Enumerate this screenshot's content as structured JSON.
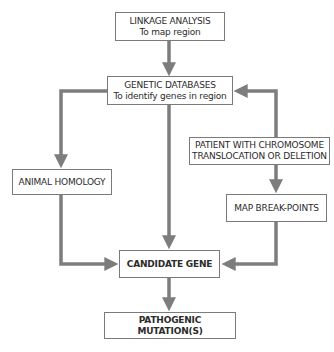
{
  "diagram": {
    "arrow_color": "#7d7d7d",
    "nodes": {
      "linkage": {
        "line1": "LINKAGE ANALYSIS",
        "line2": "To map region"
      },
      "genetic_db": {
        "line1": "GENETIC DATABASES",
        "line2": "To identify genes in region"
      },
      "animal_homology": {
        "line1": "ANIMAL HOMOLOGY"
      },
      "patient": {
        "line1": "PATIENT WITH CHROMOSOME",
        "line2": "TRANSLOCATION OR DELETION"
      },
      "map_breakpoints": {
        "line1": "MAP BREAK-POINTS"
      },
      "candidate_gene": {
        "line1": "CANDIDATE GENE"
      },
      "pathogenic": {
        "line1": "PATHOGENIC MUTATION(S)"
      }
    },
    "edges": [
      {
        "from": "linkage",
        "to": "genetic_db"
      },
      {
        "from": "genetic_db",
        "to": "animal_homology"
      },
      {
        "from": "genetic_db",
        "to": "candidate_gene"
      },
      {
        "from": "patient",
        "to": "genetic_db"
      },
      {
        "from": "patient",
        "to": "map_breakpoints"
      },
      {
        "from": "animal_homology",
        "to": "candidate_gene"
      },
      {
        "from": "map_breakpoints",
        "to": "candidate_gene"
      },
      {
        "from": "candidate_gene",
        "to": "pathogenic"
      }
    ]
  }
}
